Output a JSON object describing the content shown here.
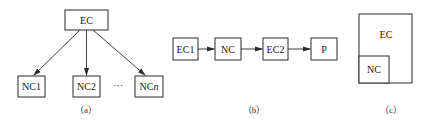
{
  "panels": {
    "a": {
      "caption": "（a）",
      "root": "EC",
      "children": [
        "NC1",
        "NC2",
        "NCn"
      ],
      "ellipsis": "···",
      "edges": [
        [
          "EC",
          "NC1"
        ],
        [
          "EC",
          "NC2"
        ],
        [
          "EC",
          "NCn"
        ]
      ]
    },
    "b": {
      "caption": "（b）",
      "chain": [
        "EC1",
        "NC",
        "EC2",
        "P"
      ],
      "edges": [
        [
          "EC1",
          "NC"
        ],
        [
          "NC",
          "EC2"
        ],
        [
          "EC2",
          "P"
        ]
      ]
    },
    "c": {
      "caption": "（c）",
      "outer": "EC",
      "inner": "NC"
    }
  },
  "colors": {
    "stroke": "#2a2a2a",
    "text": "#1a1a1a",
    "background": "#ffffff"
  }
}
